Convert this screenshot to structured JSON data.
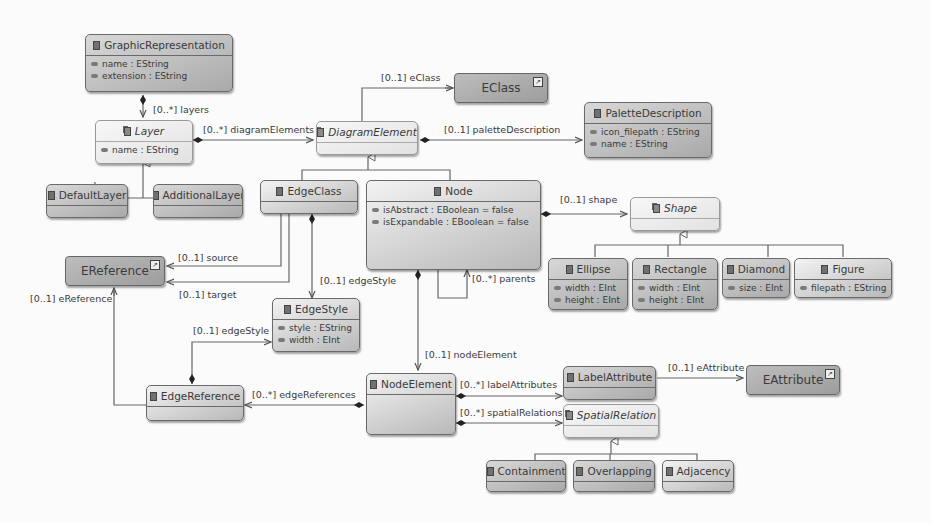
{
  "diagram": {
    "type": "ecore-class-diagram",
    "classes": {
      "graphic_representation": {
        "name": "GraphicRepresentation",
        "abstract": false,
        "attributes": [
          "name : EString",
          "extension : EString"
        ]
      },
      "layer": {
        "name": "Layer",
        "abstract": true,
        "attributes": [
          "name : EString"
        ]
      },
      "default_layer": {
        "name": "DefaultLayer",
        "abstract": false,
        "attributes": []
      },
      "additional_layer": {
        "name": "AdditionalLayer",
        "abstract": false,
        "attributes": []
      },
      "diagram_element": {
        "name": "DiagramElement",
        "abstract": true,
        "attributes": []
      },
      "palette_description": {
        "name": "PaletteDescription",
        "abstract": false,
        "attributes": [
          "icon_filepath : EString",
          "name : EString"
        ]
      },
      "edge_class": {
        "name": "EdgeClass",
        "abstract": false,
        "attributes": []
      },
      "node": {
        "name": "Node",
        "abstract": false,
        "attributes": [
          "isAbstract : EBoolean = false",
          "isExpandable : EBoolean = false"
        ]
      },
      "shape": {
        "name": "Shape",
        "abstract": true,
        "attributes": []
      },
      "ellipse": {
        "name": "Ellipse",
        "abstract": false,
        "attributes": [
          "width : EInt",
          "height : EInt"
        ]
      },
      "rectangle": {
        "name": "Rectangle",
        "abstract": false,
        "attributes": [
          "width : EInt",
          "height : EInt"
        ]
      },
      "diamond": {
        "name": "Diamond",
        "abstract": false,
        "attributes": [
          "size : EInt"
        ]
      },
      "figure": {
        "name": "Figure",
        "abstract": false,
        "attributes": [
          "filepath : EString"
        ]
      },
      "edge_style": {
        "name": "EdgeStyle",
        "abstract": false,
        "attributes": [
          "style : EString",
          "width : EInt"
        ]
      },
      "edge_reference": {
        "name": "EdgeReference",
        "abstract": false,
        "attributes": []
      },
      "node_element": {
        "name": "NodeElement",
        "abstract": false,
        "attributes": []
      },
      "label_attribute": {
        "name": "LabelAttribute",
        "abstract": false,
        "attributes": []
      },
      "spatial_relation": {
        "name": "SpatialRelation",
        "abstract": true,
        "attributes": []
      },
      "containment": {
        "name": "Containment",
        "abstract": false,
        "attributes": []
      },
      "overlapping": {
        "name": "Overlapping",
        "abstract": false,
        "attributes": []
      },
      "adjacency": {
        "name": "Adjacency",
        "abstract": false,
        "attributes": []
      }
    },
    "external_types": {
      "eclass": "EClass",
      "ereference": "EReference",
      "eattribute": "EAttribute"
    },
    "references": {
      "layers": "[0..*] layers",
      "diagram_elements": "[0..*] diagramElements",
      "eclass": "[0..1] eClass",
      "palette_description": "[0..1] paletteDescription",
      "shape": "[0..1] shape",
      "source": "[0..1] source",
      "target": "[0..1] target",
      "ereference": "[0..1] eReference",
      "edge_style_from_class": "[0..1] edgeStyle",
      "edge_style_from_ref": "[0..1] edgeStyle",
      "parents": "[0..*] parents",
      "node_element": "[0..1] nodeElement",
      "edge_references": "[0..*] edgeReferences",
      "label_attributes": "[0..*] labelAttributes",
      "spatial_relations": "[0..*] spatialRelations",
      "eattribute": "[0..1] eAttribute"
    }
  }
}
